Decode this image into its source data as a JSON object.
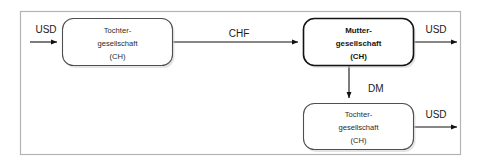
{
  "diagram": {
    "frame": {
      "label": "outer-boundary"
    },
    "colors": {
      "background": "#ffffff",
      "frame_border": "#b0b0b0",
      "node_border": "#4a4a4a",
      "node_border_emphasis": "#111111",
      "node_fill": "#ffffff",
      "connector": "#1a1a1a",
      "text": "#2b2b2b",
      "text_emphasis": "#111111",
      "shadow": "#c9c9c9"
    },
    "nodes": [
      {
        "id": "tochter-ch-left",
        "lines": [
          "Tochter-",
          "gesellschaft",
          "(CH)"
        ],
        "emphasis": false,
        "x": 62,
        "y": 18,
        "w": 110,
        "h": 47
      },
      {
        "id": "mutter-ch",
        "lines": [
          "Mutter-",
          "gesellschaft",
          "(CH)"
        ],
        "emphasis": true,
        "x": 303,
        "y": 18,
        "w": 110,
        "h": 47
      },
      {
        "id": "tochter-ch-bottom",
        "lines": [
          "Tochter-",
          "gesellschaft",
          "(CH)"
        ],
        "emphasis": false,
        "x": 303,
        "y": 103,
        "w": 110,
        "h": 46
      }
    ],
    "flows": [
      {
        "id": "inflow-usd-left",
        "label": "USD",
        "direction": "right",
        "label_x": 46,
        "label_y": 29
      },
      {
        "id": "chf-left-to-mutter",
        "label": "CHF",
        "direction": "right",
        "label_x": 239,
        "label_y": 34
      },
      {
        "id": "outflow-usd-mutter",
        "label": "USD",
        "direction": "right",
        "label_x": 436,
        "label_y": 29
      },
      {
        "id": "dm-mutter-to-tochter",
        "label": "DM",
        "direction": "down",
        "label_x": 366,
        "label_y": 88
      },
      {
        "id": "outflow-usd-tochter-bottom",
        "label": "USD",
        "direction": "right",
        "label_x": 436,
        "label_y": 114
      }
    ]
  }
}
